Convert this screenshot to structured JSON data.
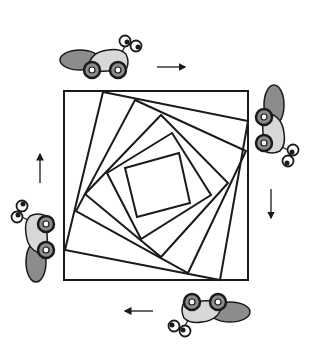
{
  "figure": {
    "colors": {
      "stroke": "#1a1a1a",
      "car_body": "#d8d8d8",
      "car_shadow": "#8c8c8c",
      "background": "#ffffff"
    },
    "squares": [
      [
        [
          64,
          91
        ],
        [
          248,
          91
        ],
        [
          248,
          280
        ],
        [
          64,
          280
        ]
      ],
      [
        [
          103,
          92
        ],
        [
          248,
          121
        ],
        [
          220,
          280
        ],
        [
          65,
          250
        ]
      ],
      [
        [
          135,
          100
        ],
        [
          246,
          151
        ],
        [
          188,
          273
        ],
        [
          76,
          211
        ]
      ],
      [
        [
          161,
          115
        ],
        [
          228,
          183
        ],
        [
          161,
          257
        ],
        [
          85,
          194
        ]
      ],
      [
        [
          172,
          133
        ],
        [
          211,
          195
        ],
        [
          141,
          239
        ],
        [
          107,
          173
        ]
      ],
      [
        [
          179,
          153
        ],
        [
          190,
          203
        ],
        [
          137,
          217
        ],
        [
          125,
          168
        ]
      ]
    ],
    "cars": [
      {
        "position": "top",
        "direction": "right"
      },
      {
        "position": "right",
        "direction": "down"
      },
      {
        "position": "bottom",
        "direction": "left"
      },
      {
        "position": "left",
        "direction": "up"
      }
    ],
    "arrows": [
      {
        "position": "top",
        "direction": "right"
      },
      {
        "position": "right",
        "direction": "down"
      },
      {
        "position": "bottom",
        "direction": "left"
      },
      {
        "position": "left",
        "direction": "up"
      }
    ]
  }
}
